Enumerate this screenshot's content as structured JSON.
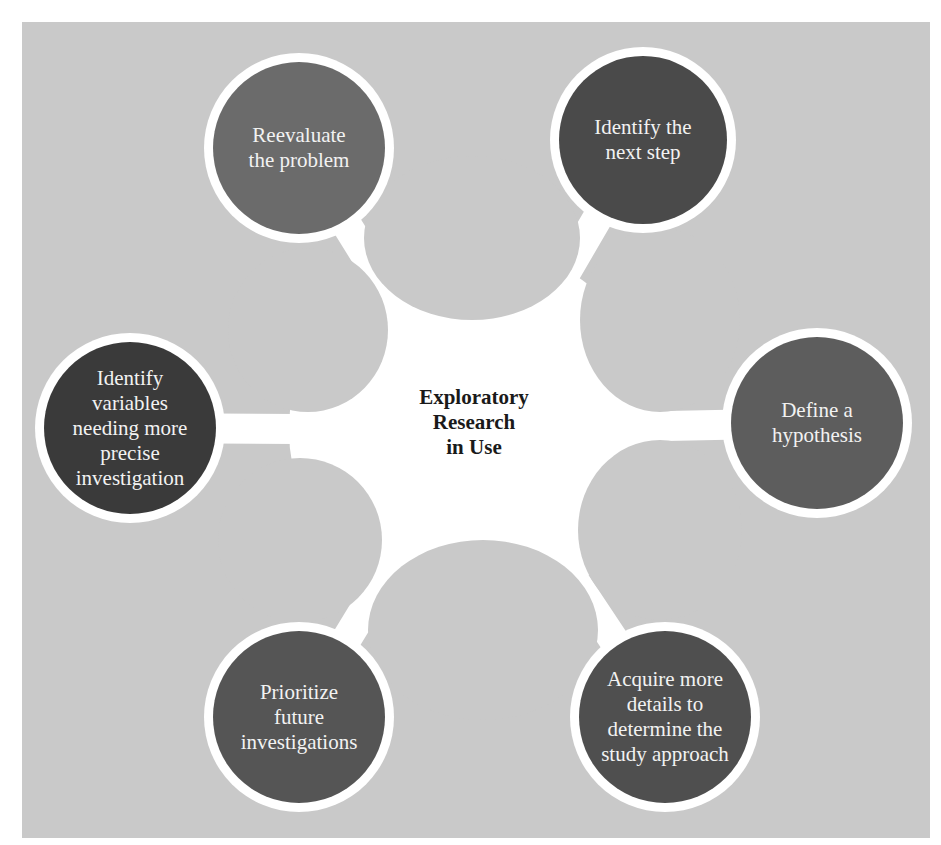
{
  "diagram": {
    "type": "hub-and-spoke",
    "center": {
      "label": "Exploratory\nResearch\n in Use"
    },
    "nodes": [
      {
        "id": "reevaluate",
        "label": "Reevaluate\nthe problem",
        "cx": 299,
        "cy": 148,
        "r": 86,
        "color": "#6b6b6b"
      },
      {
        "id": "next-step",
        "label": "Identify the\nnext step",
        "cx": 643,
        "cy": 140,
        "r": 84,
        "color": "#4a4a4a"
      },
      {
        "id": "variables",
        "label": "Identify\nvariables\nneeding more\nprecise\ninvestigation",
        "cx": 130,
        "cy": 428,
        "r": 86,
        "color": "#3a3a3a"
      },
      {
        "id": "hypothesis",
        "label": "Define a\nhypothesis",
        "cx": 817,
        "cy": 423,
        "r": 86,
        "color": "#5d5d5d"
      },
      {
        "id": "prioritize",
        "label": "Prioritize\nfuture\ninvestigations",
        "cx": 299,
        "cy": 717,
        "r": 86,
        "color": "#555555"
      },
      {
        "id": "acquire",
        "label": "Acquire more\ndetails to\ndetermine the\nstudy approach",
        "cx": 665,
        "cy": 717,
        "r": 86,
        "color": "#4f4f4f"
      }
    ],
    "colors": {
      "background": "#c9c9c9",
      "connector": "#ffffff",
      "ring": "#ffffff",
      "node_text": "#f2f2f2",
      "center_text": "#1a1a1a"
    }
  }
}
